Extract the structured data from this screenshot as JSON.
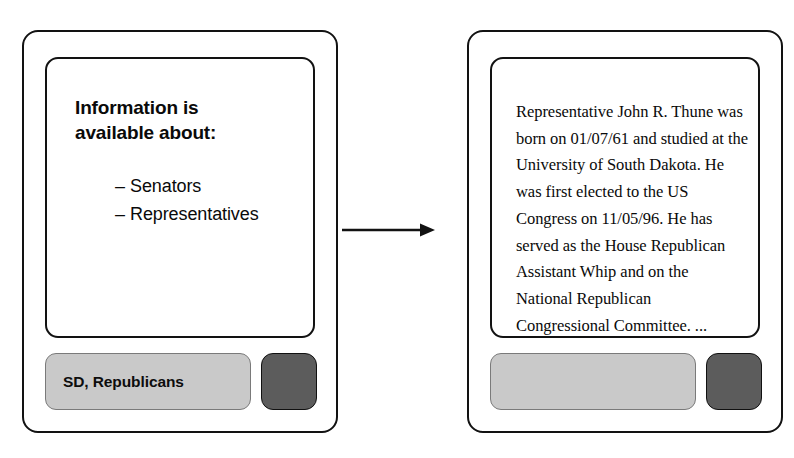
{
  "diagram": {
    "arrow": {
      "icon": "arrow-right-icon",
      "direction": "left-to-right"
    }
  },
  "left_device": {
    "screen": {
      "heading_line_1": "Information is",
      "heading_line_2": "available about:",
      "options": [
        {
          "dash": "–",
          "label": "Senators"
        },
        {
          "dash": "–",
          "label": "Representatives"
        }
      ]
    },
    "controls": {
      "text_field_value": "SD, Republicans",
      "action_button_label": ""
    }
  },
  "right_device": {
    "screen": {
      "result_text": "Representative John R. Thune was born on 01/07/61 and studied at the University of South Dakota. He was first elected to the US Congress on 11/05/96. He has served as the House Republican Assistant Whip and on the National Republican Congressional Committee. ..."
    },
    "controls": {
      "text_field_value": "",
      "action_button_label": ""
    }
  },
  "colors": {
    "outline": "#121212",
    "field_fill": "#c9c9c9",
    "button_fill": "#5c5c5c",
    "text": "#0a0a0a",
    "background": "#ffffff"
  }
}
